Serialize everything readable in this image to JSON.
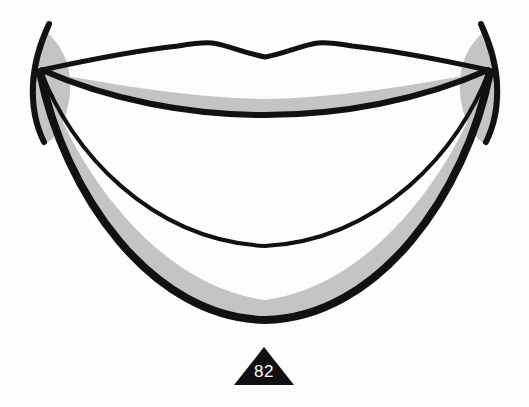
{
  "figure": {
    "background_color": "#fdfdfd",
    "stroke_color": "#111111",
    "shade_color": "#c4c4c4",
    "marker_fill": "#111111",
    "marker_text_color": "#ffffff"
  },
  "marker": {
    "label": "82",
    "shape": "triangle"
  },
  "vertices": {
    "left": {
      "x": 40,
      "y": 70
    },
    "right": {
      "x": 490,
      "y": 70
    }
  },
  "curves": [
    {
      "name": "upper-vermilion-border",
      "description": "wavy cupid's bow top outline with two peaks and central dip",
      "peak_left": {
        "x": 212,
        "y": 43
      },
      "center_dip": {
        "x": 265,
        "y": 57
      },
      "peak_right": {
        "x": 325,
        "y": 43
      },
      "stroke_width": 5
    },
    {
      "name": "upper-inner-contour",
      "description": "shallow arc below the top curve bounding the upper gray band",
      "lowest": {
        "x": 265,
        "y": 112
      },
      "stroke_width": 6
    },
    {
      "name": "middle-contour",
      "description": "thin sweeping arc across the middle of the figure",
      "lowest": {
        "x": 265,
        "y": 245
      },
      "stroke_width": 4
    },
    {
      "name": "lower-outer-contour",
      "description": "thick bottom arc bounding the lower gray band",
      "lowest": {
        "x": 265,
        "y": 318
      },
      "stroke_width": 8
    }
  ],
  "shaded_bands": [
    {
      "name": "upper-gray-band",
      "color": "#c4c4c4",
      "position": "between upper inner contour and its arc above"
    },
    {
      "name": "lower-gray-band",
      "color": "#c4c4c4",
      "position": "between middle contour region and lower outer contour"
    },
    {
      "name": "left-vertex-blade",
      "color": "#c4c4c4",
      "position": "leaf shape at left convergence point"
    },
    {
      "name": "right-vertex-blade",
      "color": "#c4c4c4",
      "position": "leaf shape at right convergence point"
    }
  ]
}
